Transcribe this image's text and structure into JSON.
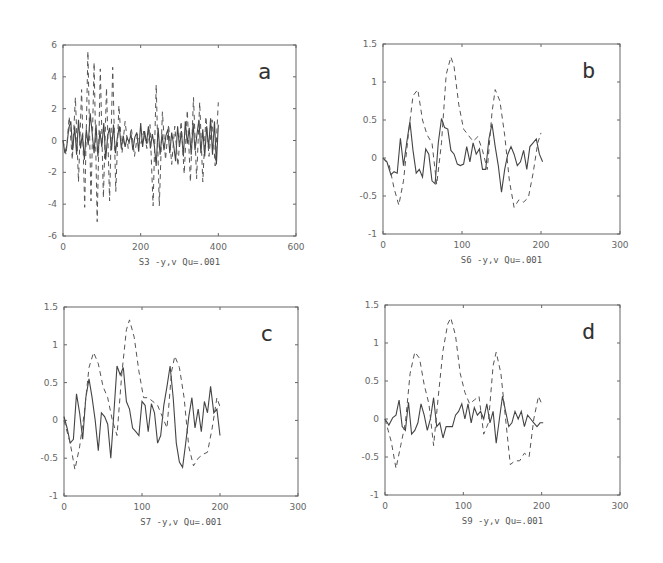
{
  "figure": {
    "background": "#ffffff",
    "line_color_solid": "#444444",
    "line_color_dashed": "#555555"
  },
  "chart_data": [
    {
      "type": "line",
      "panel": "a",
      "title": "",
      "xlabel": "S3 -y,v Qu=.001",
      "ylabel": "",
      "xlim": [
        0,
        600
      ],
      "ylim": [
        -6,
        6
      ],
      "xticks": [
        0,
        200,
        400,
        600
      ],
      "yticks": [
        -6,
        -4,
        -2,
        0,
        2,
        4,
        6
      ],
      "grid": false,
      "box": {
        "left": 63,
        "top": 45,
        "right": 296,
        "bottom": 236
      },
      "series": [
        {
          "name": "y",
          "style": "solid",
          "x": [
            0,
            5,
            10,
            15,
            20,
            25,
            30,
            35,
            40,
            45,
            50,
            55,
            60,
            65,
            70,
            75,
            80,
            85,
            90,
            95,
            100,
            105,
            110,
            115,
            120,
            125,
            130,
            135,
            140,
            145,
            150,
            155,
            160,
            165,
            170,
            175,
            180,
            185,
            190,
            195,
            200,
            205,
            210,
            215,
            220,
            225,
            230,
            235,
            240,
            245,
            250,
            255,
            260,
            265,
            270,
            275,
            280,
            285,
            290,
            295,
            300,
            305,
            310,
            315,
            320,
            325,
            330,
            335,
            340,
            345,
            350,
            355,
            360,
            365,
            370,
            375,
            380,
            385,
            390,
            395,
            400
          ],
          "y": [
            0,
            -0.8,
            -0.3,
            0.8,
            1.2,
            -0.6,
            0.9,
            -0.9,
            1.3,
            -0.5,
            0.4,
            -1.2,
            0.7,
            -0.3,
            1.7,
            0.5,
            -0.8,
            1.0,
            -1.0,
            0.6,
            -0.4,
            1.1,
            -1.2,
            0.3,
            0.8,
            -0.6,
            1.0,
            -0.8,
            0.2,
            0.9,
            -0.5,
            0.3,
            -0.4,
            0.2,
            -0.1,
            0.4,
            -0.6,
            0.2,
            0.5,
            -0.7,
            1.1,
            -0.4,
            0.6,
            -0.2,
            0.9,
            -0.5,
            0.4,
            -0.3,
            -1.6,
            0.8,
            -0.9,
            0.4,
            -0.6,
            0.3,
            0.7,
            -0.8,
            0.5,
            -0.3,
            -1.3,
            0.9,
            -0.4,
            0.6,
            -1.0,
            1.2,
            -0.2,
            0.8,
            -0.9,
            1.1,
            -0.6,
            0.4,
            1.3,
            -0.8,
            0.7,
            -1.0,
            0.9,
            -0.5,
            1.4,
            -0.9,
            1.2,
            -1.5,
            1.0
          ]
        },
        {
          "name": "v",
          "style": "dashed",
          "x": [
            0,
            8,
            16,
            24,
            32,
            40,
            48,
            56,
            64,
            72,
            80,
            88,
            96,
            104,
            112,
            120,
            128,
            136,
            144,
            152,
            160,
            168,
            176,
            184,
            192,
            200,
            208,
            216,
            224,
            232,
            240,
            248,
            256,
            264,
            272,
            280,
            288,
            296,
            304,
            312,
            320,
            328,
            336,
            344,
            352,
            360,
            368,
            376,
            384,
            392,
            400
          ],
          "y": [
            0,
            -0.9,
            1.5,
            -1.2,
            2.7,
            -2.6,
            3.2,
            -4.2,
            5.6,
            -3.8,
            4.9,
            -5.1,
            4.5,
            -3.6,
            3.3,
            -3.8,
            4.6,
            -3.2,
            2.2,
            -0.8,
            1.2,
            -0.5,
            0.8,
            -1.0,
            0.4,
            -0.3,
            0.6,
            -0.5,
            1.0,
            -4.1,
            3.5,
            -4.1,
            1.8,
            -1.2,
            1.0,
            -1.5,
            0.9,
            -1.6,
            1.2,
            -2.1,
            1.9,
            -2.6,
            2.7,
            -2.4,
            2.4,
            -2.6,
            1.5,
            -1.0,
            1.3,
            -1.6,
            2.4
          ]
        }
      ]
    },
    {
      "type": "line",
      "panel": "b",
      "title": "",
      "xlabel": "S6 -y,v Qu=.001",
      "ylabel": "",
      "xlim": [
        0,
        300
      ],
      "ylim": [
        -1,
        1.5
      ],
      "xticks": [
        0,
        100,
        200,
        300
      ],
      "yticks": [
        -1,
        -0.5,
        0,
        0.5,
        1,
        1.5
      ],
      "ytick_labels": [
        "-1",
        "-0.5",
        "0",
        "0.5",
        "1",
        "1.5"
      ],
      "grid": false,
      "box": {
        "left": 383,
        "top": 44,
        "right": 620,
        "bottom": 234
      },
      "series": [
        {
          "name": "y",
          "style": "solid",
          "x": [
            0,
            5,
            10,
            14,
            18,
            22,
            26,
            30,
            34,
            38,
            42,
            46,
            50,
            54,
            58,
            62,
            66,
            70,
            74,
            78,
            82,
            86,
            90,
            94,
            98,
            102,
            106,
            110,
            114,
            118,
            122,
            126,
            130,
            134,
            138,
            142,
            146,
            150,
            154,
            158,
            162,
            166,
            170,
            174,
            178,
            182,
            186,
            190,
            194,
            198,
            202
          ],
          "y": [
            0,
            -0.05,
            -0.22,
            -0.18,
            -0.2,
            0.26,
            -0.1,
            0.2,
            0.48,
            0.1,
            -0.2,
            -0.15,
            -0.25,
            0.12,
            0.05,
            -0.3,
            -0.34,
            0.2,
            0.52,
            0.4,
            0.38,
            0.1,
            0.05,
            -0.08,
            -0.1,
            -0.08,
            0.15,
            -0.05,
            0.2,
            0.05,
            0.12,
            -0.15,
            -0.15,
            0.25,
            0.45,
            0.15,
            -0.1,
            -0.45,
            -0.15,
            0.05,
            0.15,
            0.05,
            -0.1,
            -0.05,
            0.1,
            -0.15,
            0.15,
            0.2,
            0.25,
            0.05,
            -0.05
          ]
        },
        {
          "name": "v",
          "style": "dashed",
          "x": [
            0,
            8,
            14,
            20,
            26,
            32,
            38,
            44,
            50,
            56,
            62,
            68,
            74,
            80,
            86,
            90,
            96,
            102,
            108,
            114,
            120,
            126,
            132,
            138,
            142,
            148,
            154,
            160,
            166,
            172,
            178,
            184,
            190,
            196,
            200
          ],
          "y": [
            0,
            -0.1,
            -0.4,
            -0.62,
            -0.3,
            0.3,
            0.82,
            0.9,
            0.5,
            0.3,
            0.2,
            -0.35,
            0.2,
            1.1,
            1.33,
            1.2,
            0.7,
            0.38,
            0.3,
            0.22,
            0.28,
            0.1,
            -0.15,
            0.6,
            0.9,
            0.75,
            0.3,
            -0.3,
            -0.65,
            -0.55,
            -0.58,
            -0.52,
            -0.2,
            0.2,
            0.33
          ]
        }
      ]
    },
    {
      "type": "line",
      "panel": "c",
      "title": "",
      "xlabel": "S7 -y,v Qu=.001",
      "ylabel": "",
      "xlim": [
        0,
        300
      ],
      "ylim": [
        -1,
        1.5
      ],
      "xticks": [
        0,
        100,
        200,
        300
      ],
      "yticks": [
        -1,
        -0.5,
        0,
        0.5,
        1,
        1.5
      ],
      "ytick_labels": [
        "-1",
        "-0.5",
        "0",
        "0.5",
        "1",
        "1.5"
      ],
      "grid": false,
      "box": {
        "left": 64,
        "top": 307,
        "right": 298,
        "bottom": 496
      },
      "series": [
        {
          "name": "y",
          "style": "solid",
          "x": [
            0,
            4,
            8,
            12,
            16,
            20,
            24,
            28,
            32,
            36,
            40,
            44,
            48,
            52,
            56,
            60,
            64,
            68,
            72,
            76,
            80,
            84,
            88,
            92,
            96,
            100,
            104,
            108,
            112,
            116,
            120,
            124,
            128,
            132,
            136,
            140,
            144,
            148,
            152,
            156,
            160,
            164,
            168,
            172,
            176,
            180,
            184,
            188,
            192,
            196,
            200
          ],
          "y": [
            0.05,
            -0.1,
            -0.3,
            -0.25,
            0.35,
            0.1,
            -0.25,
            0.3,
            0.55,
            0.3,
            0.0,
            -0.4,
            0.1,
            0.05,
            -0.05,
            -0.5,
            0.1,
            0.72,
            0.6,
            0.7,
            0.25,
            0.15,
            -0.1,
            -0.15,
            -0.2,
            0.25,
            0.2,
            -0.15,
            0.22,
            0.1,
            -0.3,
            -0.2,
            0.2,
            0.45,
            0.72,
            0.3,
            -0.3,
            -0.55,
            -0.62,
            -0.3,
            0.05,
            0.3,
            -0.1,
            0.15,
            -0.15,
            0.25,
            0.1,
            0.45,
            0.1,
            0.15,
            -0.2
          ]
        },
        {
          "name": "v",
          "style": "dashed",
          "x": [
            0,
            8,
            14,
            20,
            26,
            32,
            38,
            44,
            50,
            56,
            62,
            68,
            74,
            80,
            84,
            90,
            96,
            102,
            108,
            114,
            120,
            126,
            132,
            138,
            142,
            148,
            154,
            160,
            166,
            172,
            178,
            184,
            190,
            196,
            200
          ],
          "y": [
            0,
            -0.3,
            -0.65,
            -0.35,
            0.1,
            0.7,
            0.9,
            0.75,
            0.45,
            0.3,
            0.0,
            -0.2,
            0.6,
            1.2,
            1.33,
            1.1,
            0.65,
            0.3,
            0.3,
            0.25,
            0.2,
            0.05,
            -0.1,
            0.65,
            0.85,
            0.7,
            0.3,
            -0.35,
            -0.6,
            -0.5,
            -0.45,
            -0.42,
            -0.1,
            0.3,
            0.18
          ]
        }
      ]
    },
    {
      "type": "line",
      "panel": "d",
      "title": "",
      "xlabel": "S9 -y,v Qu=.001",
      "ylabel": "",
      "xlim": [
        0,
        300
      ],
      "ylim": [
        -1,
        1.5
      ],
      "xticks": [
        0,
        100,
        200,
        300
      ],
      "yticks": [
        -1,
        -0.5,
        0,
        0.5,
        1,
        1.5
      ],
      "ytick_labels": [
        "-1",
        "-0.5",
        "0",
        "0.5",
        "1",
        "1.5"
      ],
      "grid": false,
      "box": {
        "left": 385,
        "top": 305,
        "right": 620,
        "bottom": 495
      },
      "series": [
        {
          "name": "y",
          "style": "solid",
          "x": [
            0,
            5,
            10,
            14,
            18,
            22,
            26,
            30,
            34,
            38,
            42,
            46,
            50,
            54,
            58,
            62,
            66,
            70,
            74,
            78,
            82,
            86,
            90,
            94,
            98,
            102,
            106,
            110,
            114,
            118,
            122,
            126,
            130,
            134,
            138,
            142,
            146,
            150,
            154,
            158,
            162,
            166,
            170,
            174,
            178,
            182,
            186,
            190,
            194,
            198,
            202
          ],
          "y": [
            0.0,
            -0.08,
            0.02,
            0.05,
            0.25,
            -0.1,
            -0.15,
            0.22,
            -0.2,
            -0.15,
            -0.05,
            0.2,
            0.05,
            -0.15,
            0.0,
            0.28,
            -0.1,
            -0.05,
            -0.25,
            -0.1,
            -0.1,
            -0.1,
            0.05,
            0.1,
            0.2,
            0.0,
            0.2,
            -0.05,
            0.15,
            0.05,
            0.1,
            0.0,
            0.2,
            -0.05,
            0.1,
            -0.32,
            0.0,
            0.3,
            0.1,
            -0.1,
            -0.05,
            0.1,
            0.0,
            0.1,
            -0.1,
            0.05,
            0.0,
            -0.05,
            -0.1,
            -0.05,
            -0.05
          ]
        },
        {
          "name": "v",
          "style": "dashed",
          "x": [
            0,
            8,
            14,
            20,
            26,
            32,
            38,
            44,
            50,
            56,
            62,
            68,
            74,
            80,
            84,
            90,
            96,
            102,
            108,
            114,
            120,
            126,
            132,
            138,
            142,
            148,
            154,
            160,
            166,
            172,
            178,
            184,
            190,
            196,
            200
          ],
          "y": [
            0,
            -0.3,
            -0.65,
            -0.35,
            -0.05,
            0.6,
            0.88,
            0.8,
            0.45,
            0.2,
            -0.35,
            0.3,
            0.9,
            1.25,
            1.33,
            1.1,
            0.6,
            0.35,
            0.2,
            0.25,
            0.3,
            -0.2,
            -0.05,
            0.7,
            0.88,
            0.6,
            0.0,
            -0.6,
            -0.55,
            -0.55,
            -0.45,
            -0.5,
            0.0,
            0.3,
            0.2
          ]
        }
      ]
    }
  ]
}
